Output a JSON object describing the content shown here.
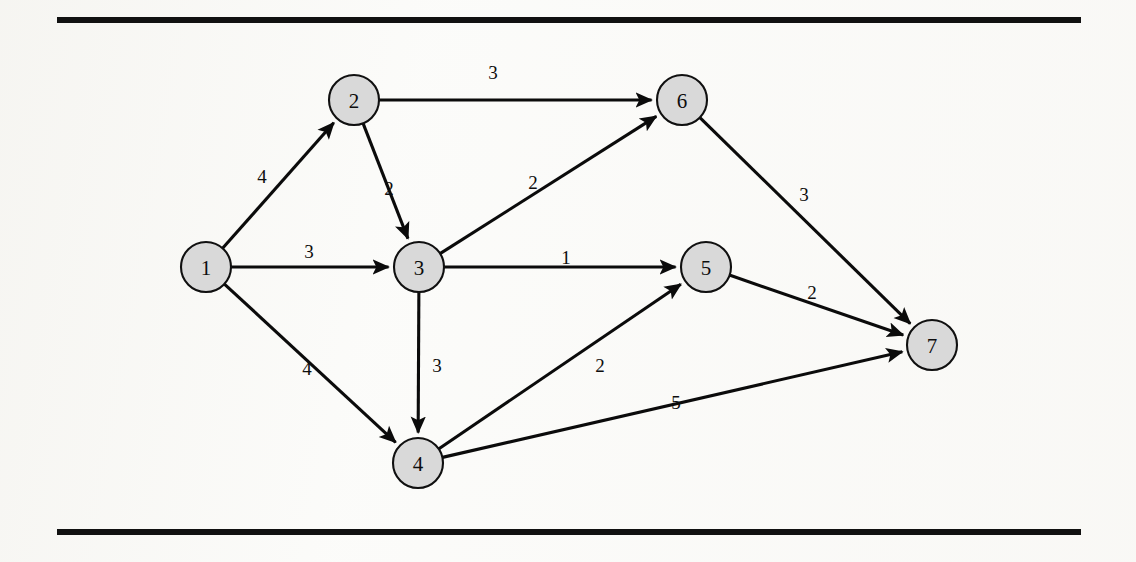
{
  "figure": {
    "kind": "directed-weighted-graph",
    "background_color": "#fbfbf9",
    "node_fill_color": "#d9d9d9",
    "node_stroke_color": "#101010",
    "edge_color": "#0b0b0b",
    "rules": [
      {
        "name": "top-rule",
        "x": 57,
        "y": 17,
        "width": 1024,
        "height": 6,
        "color": "#111111"
      },
      {
        "name": "bottom-rule",
        "x": 57,
        "y": 529,
        "width": 1024,
        "height": 6,
        "color": "#111111"
      }
    ]
  },
  "chart_data": {
    "type": "diagram",
    "title": "",
    "xlabel": "",
    "ylabel": "",
    "node_radius": 25,
    "nodes": [
      {
        "id": "1",
        "label": "1",
        "x": 206,
        "y": 267
      },
      {
        "id": "2",
        "label": "2",
        "x": 354,
        "y": 100
      },
      {
        "id": "3",
        "label": "3",
        "x": 419,
        "y": 267
      },
      {
        "id": "4",
        "label": "4",
        "x": 418,
        "y": 463
      },
      {
        "id": "5",
        "label": "5",
        "x": 706,
        "y": 267
      },
      {
        "id": "6",
        "label": "6",
        "x": 682,
        "y": 100
      },
      {
        "id": "7",
        "label": "7",
        "x": 932,
        "y": 345
      }
    ],
    "edges": [
      {
        "from": "1",
        "to": "2",
        "weight": "4",
        "label_x": 262,
        "label_y": 176
      },
      {
        "from": "1",
        "to": "3",
        "weight": "3",
        "label_x": 309,
        "label_y": 251
      },
      {
        "from": "1",
        "to": "4",
        "weight": "4",
        "label_x": 307,
        "label_y": 368
      },
      {
        "from": "2",
        "to": "6",
        "weight": "3",
        "label_x": 493,
        "label_y": 72
      },
      {
        "from": "2",
        "to": "3",
        "weight": "2",
        "label_x": 389,
        "label_y": 188
      },
      {
        "from": "3",
        "to": "6",
        "weight": "2",
        "label_x": 533,
        "label_y": 182
      },
      {
        "from": "3",
        "to": "5",
        "weight": "1",
        "label_x": 566,
        "label_y": 257
      },
      {
        "from": "3",
        "to": "4",
        "weight": "3",
        "label_x": 437,
        "label_y": 365
      },
      {
        "from": "4",
        "to": "5",
        "weight": "2",
        "label_x": 600,
        "label_y": 365
      },
      {
        "from": "4",
        "to": "7",
        "weight": "5",
        "label_x": 676,
        "label_y": 402
      },
      {
        "from": "5",
        "to": "7",
        "weight": "2",
        "label_x": 812,
        "label_y": 292
      },
      {
        "from": "6",
        "to": "7",
        "weight": "3",
        "label_x": 804,
        "label_y": 194
      }
    ]
  }
}
